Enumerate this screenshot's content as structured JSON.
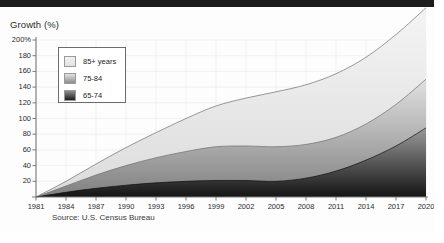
{
  "figure": {
    "axis_title": "Growth (%)",
    "source_note": "Source: U.S. Census Bureau"
  },
  "legend": {
    "items": [
      {
        "label": "85+ years",
        "swatch": "light-gray-swatch"
      },
      {
        "label": "75-84",
        "swatch": "medium-gray-swatch"
      },
      {
        "label": "65-74",
        "swatch": "dark-gray-swatch"
      }
    ]
  },
  "chart_data": {
    "type": "area",
    "stacked": true,
    "title": "Growth (%)",
    "xlabel": "",
    "ylabel": "Growth (%)",
    "xlim": [
      1981,
      2020
    ],
    "ylim": [
      0,
      200
    ],
    "grid": true,
    "legend_position": "top-left-inside",
    "annotations": [
      "Source: U.S. Census Bureau"
    ],
    "ytick_labels": [
      "200%",
      "180",
      "160",
      "140",
      "120",
      "100",
      "80",
      "60",
      "40",
      "20"
    ],
    "ytick_values": [
      200,
      180,
      160,
      140,
      120,
      100,
      80,
      60,
      40,
      20
    ],
    "xtick_labels": [
      "1981",
      "1984",
      "1987",
      "1990",
      "1993",
      "1996",
      "1999",
      "2002",
      "2005",
      "2008",
      "2011",
      "2014",
      "2017",
      "2020"
    ],
    "xtick_values": [
      1981,
      1984,
      1987,
      1990,
      1993,
      1996,
      1999,
      2002,
      2005,
      2008,
      2011,
      2014,
      2017,
      2020
    ],
    "x": [
      1981,
      1984,
      1987,
      1990,
      1993,
      1996,
      1999,
      2002,
      2005,
      2008,
      2011,
      2014,
      2017,
      2020
    ],
    "series": [
      {
        "name": "65-74",
        "color": "#262626",
        "values": [
          0,
          6,
          11,
          15,
          18,
          20,
          21,
          21,
          20,
          24,
          33,
          47,
          65,
          88
        ]
      },
      {
        "name": "75-84",
        "color": "#8d8d8d",
        "values": [
          0,
          8,
          17,
          25,
          32,
          38,
          43,
          44,
          44,
          43,
          43,
          46,
          53,
          62
        ]
      },
      {
        "name": "85+ years",
        "color": "#e8e8e8",
        "values": [
          0,
          6,
          14,
          23,
          32,
          42,
          52,
          61,
          70,
          76,
          81,
          85,
          89,
          91
        ]
      }
    ],
    "cumulative_totals": [
      0,
      20,
      42,
      63,
      82,
      100,
      116,
      126,
      134,
      143,
      157,
      178,
      207,
      241
    ]
  }
}
